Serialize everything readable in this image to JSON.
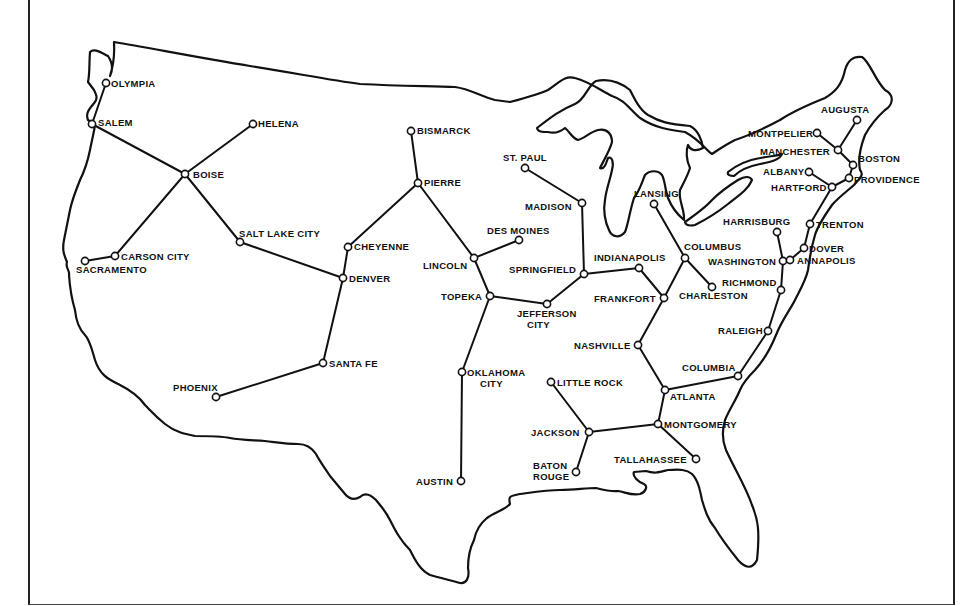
{
  "map": {
    "title": "",
    "subject": "United States state capitals connected as a graph network",
    "colors": {
      "ink": "#111111",
      "background": "#ffffff",
      "frame": "#222222"
    },
    "nodes": [
      {
        "id": "olympia",
        "label": "OLYMPIA",
        "x": 106,
        "y": 83,
        "lx": 111,
        "ly": 87,
        "anchor": "start"
      },
      {
        "id": "salem",
        "label": "SALEM",
        "x": 92,
        "y": 124,
        "lx": 98,
        "ly": 126,
        "anchor": "start"
      },
      {
        "id": "helena",
        "label": "HELENA",
        "x": 253,
        "y": 124,
        "lx": 258,
        "ly": 127,
        "anchor": "start"
      },
      {
        "id": "boise",
        "label": "BOISE",
        "x": 185,
        "y": 174,
        "lx": 193,
        "ly": 178,
        "anchor": "start"
      },
      {
        "id": "carson_city",
        "label": "CARSON CITY",
        "x": 115,
        "y": 256,
        "lx": 121,
        "ly": 260,
        "anchor": "start"
      },
      {
        "id": "sacramento",
        "label": "SACRAMENTO",
        "x": 85,
        "y": 261,
        "lx": 76,
        "ly": 273,
        "anchor": "start"
      },
      {
        "id": "salt_lake_city",
        "label": "SALT LAKE CITY",
        "x": 240,
        "y": 242,
        "lx": 239,
        "ly": 237,
        "anchor": "start"
      },
      {
        "id": "cheyenne",
        "label": "CHEYENNE",
        "x": 348,
        "y": 247,
        "lx": 354,
        "ly": 250,
        "anchor": "start"
      },
      {
        "id": "denver",
        "label": "DENVER",
        "x": 343,
        "y": 278,
        "lx": 349,
        "ly": 282,
        "anchor": "start"
      },
      {
        "id": "santa_fe",
        "label": "SANTA FE",
        "x": 323,
        "y": 363,
        "lx": 329,
        "ly": 367,
        "anchor": "start"
      },
      {
        "id": "phoenix",
        "label": "PHOENIX",
        "x": 216,
        "y": 397,
        "lx": 173,
        "ly": 391,
        "anchor": "start"
      },
      {
        "id": "bismarck",
        "label": "BISMARCK",
        "x": 411,
        "y": 131,
        "lx": 417,
        "ly": 134,
        "anchor": "start"
      },
      {
        "id": "pierre",
        "label": "PIERRE",
        "x": 418,
        "y": 183,
        "lx": 424,
        "ly": 186,
        "anchor": "start"
      },
      {
        "id": "lincoln",
        "label": "LINCOLN",
        "x": 474,
        "y": 258,
        "lx": 423,
        "ly": 269,
        "anchor": "start"
      },
      {
        "id": "des_moines",
        "label": "DES MOINES",
        "x": 519,
        "y": 240,
        "lx": 487,
        "ly": 234,
        "anchor": "start"
      },
      {
        "id": "topeka",
        "label": "TOPEKA",
        "x": 490,
        "y": 296,
        "lx": 441,
        "ly": 300,
        "anchor": "start"
      },
      {
        "id": "jefferson_city",
        "label": "JEFFERSON",
        "label2": "CITY",
        "x": 547,
        "y": 304,
        "lx": 517,
        "ly": 317,
        "anchor": "start"
      },
      {
        "id": "oklahoma_city",
        "label": "OKLAHOMA",
        "label2": "CITY",
        "x": 462,
        "y": 372,
        "lx": 467,
        "ly": 376,
        "anchor": "start"
      },
      {
        "id": "austin",
        "label": "AUSTIN",
        "x": 461,
        "y": 481,
        "lx": 416,
        "ly": 485,
        "anchor": "start"
      },
      {
        "id": "st_paul",
        "label": "ST. PAUL",
        "x": 525,
        "y": 168,
        "lx": 503,
        "ly": 161,
        "anchor": "start"
      },
      {
        "id": "madison",
        "label": "MADISON",
        "x": 582,
        "y": 203,
        "lx": 525,
        "ly": 210,
        "anchor": "start"
      },
      {
        "id": "springfield",
        "label": "SPRINGFIELD",
        "x": 584,
        "y": 274,
        "lx": 509,
        "ly": 273,
        "anchor": "start"
      },
      {
        "id": "indianapolis",
        "label": "INDIANAPOLIS",
        "x": 639,
        "y": 268,
        "lx": 594,
        "ly": 261,
        "anchor": "start"
      },
      {
        "id": "frankfort",
        "label": "FRANKFORT",
        "x": 664,
        "y": 298,
        "lx": 594,
        "ly": 302,
        "anchor": "start"
      },
      {
        "id": "lansing",
        "label": "LANSING",
        "x": 654,
        "y": 204,
        "lx": 634,
        "ly": 197,
        "anchor": "start"
      },
      {
        "id": "columbus",
        "label": "COLUMBUS",
        "x": 685,
        "y": 258,
        "lx": 684,
        "ly": 250,
        "anchor": "start"
      },
      {
        "id": "charleston",
        "label": "CHARLESTON",
        "x": 712,
        "y": 287,
        "lx": 679,
        "ly": 299,
        "anchor": "start"
      },
      {
        "id": "nashville",
        "label": "NASHVILLE",
        "x": 638,
        "y": 345,
        "lx": 574,
        "ly": 349,
        "anchor": "start"
      },
      {
        "id": "atlanta",
        "label": "ATLANTA",
        "x": 665,
        "y": 390,
        "lx": 670,
        "ly": 400,
        "anchor": "start"
      },
      {
        "id": "columbia",
        "label": "COLUMBIA",
        "x": 738,
        "y": 376,
        "lx": 682,
        "ly": 371,
        "anchor": "start"
      },
      {
        "id": "raleigh",
        "label": "RALEIGH",
        "x": 768,
        "y": 331,
        "lx": 718,
        "ly": 334,
        "anchor": "start"
      },
      {
        "id": "richmond",
        "label": "RICHMOND",
        "x": 781,
        "y": 290,
        "lx": 722,
        "ly": 286,
        "anchor": "start"
      },
      {
        "id": "washington",
        "label": "WASHINGTON",
        "x": 783,
        "y": 261,
        "lx": 708,
        "ly": 265,
        "anchor": "start"
      },
      {
        "id": "harrisburg",
        "label": "HARRISBURG",
        "x": 777,
        "y": 232,
        "lx": 723,
        "ly": 225,
        "anchor": "start"
      },
      {
        "id": "annapolis",
        "label": "ANNAPOLIS",
        "x": 790,
        "y": 260,
        "lx": 797,
        "ly": 264,
        "anchor": "start"
      },
      {
        "id": "dover",
        "label": "DOVER",
        "x": 804,
        "y": 248,
        "lx": 809,
        "ly": 252,
        "anchor": "start"
      },
      {
        "id": "trenton",
        "label": "TRENTON",
        "x": 810,
        "y": 224,
        "lx": 816,
        "ly": 228,
        "anchor": "start"
      },
      {
        "id": "montgomery",
        "label": "MONTGOMERY",
        "x": 658,
        "y": 424,
        "lx": 664,
        "ly": 428,
        "anchor": "start"
      },
      {
        "id": "tallahassee",
        "label": "TALLAHASSEE",
        "x": 696,
        "y": 459,
        "lx": 614,
        "ly": 463,
        "anchor": "start"
      },
      {
        "id": "jackson",
        "label": "JACKSON",
        "x": 589,
        "y": 432,
        "lx": 531,
        "ly": 436,
        "anchor": "start"
      },
      {
        "id": "little_rock",
        "label": "LITTLE ROCK",
        "x": 551,
        "y": 382,
        "lx": 557,
        "ly": 386,
        "anchor": "start"
      },
      {
        "id": "baton_rouge",
        "label": "BATON",
        "label2": "ROUGE",
        "x": 576,
        "y": 472,
        "lx": 533,
        "ly": 469,
        "anchor": "start"
      },
      {
        "id": "hartford",
        "label": "HARTFORD",
        "x": 832,
        "y": 187,
        "lx": 771,
        "ly": 191,
        "anchor": "start"
      },
      {
        "id": "providence",
        "label": "PROVIDENCE",
        "x": 849,
        "y": 178,
        "lx": 854,
        "ly": 183,
        "anchor": "start"
      },
      {
        "id": "boston",
        "label": "BOSTON",
        "x": 853,
        "y": 165,
        "lx": 858,
        "ly": 162,
        "anchor": "start"
      },
      {
        "id": "albany",
        "label": "ALBANY",
        "x": 809,
        "y": 172,
        "lx": 763,
        "ly": 175,
        "anchor": "start"
      },
      {
        "id": "manchester",
        "label": "MANCHESTER",
        "x": 838,
        "y": 150,
        "lx": 760,
        "ly": 155,
        "anchor": "start"
      },
      {
        "id": "montpelier",
        "label": "MONTPELIER",
        "x": 817,
        "y": 133,
        "lx": 748,
        "ly": 137,
        "anchor": "start"
      },
      {
        "id": "augusta",
        "label": "AUGUSTA",
        "x": 857,
        "y": 120,
        "lx": 821,
        "ly": 113,
        "anchor": "start"
      }
    ],
    "edges": [
      [
        "olympia",
        "salem"
      ],
      [
        "salem",
        "boise"
      ],
      [
        "helena",
        "boise"
      ],
      [
        "boise",
        "carson_city"
      ],
      [
        "boise",
        "salt_lake_city"
      ],
      [
        "carson_city",
        "sacramento"
      ],
      [
        "salt_lake_city",
        "denver"
      ],
      [
        "cheyenne",
        "denver"
      ],
      [
        "cheyenne",
        "pierre"
      ],
      [
        "denver",
        "santa_fe"
      ],
      [
        "santa_fe",
        "phoenix"
      ],
      [
        "bismarck",
        "pierre"
      ],
      [
        "pierre",
        "lincoln"
      ],
      [
        "lincoln",
        "des_moines"
      ],
      [
        "lincoln",
        "topeka"
      ],
      [
        "topeka",
        "jefferson_city"
      ],
      [
        "topeka",
        "oklahoma_city"
      ],
      [
        "oklahoma_city",
        "austin"
      ],
      [
        "jefferson_city",
        "springfield"
      ],
      [
        "st_paul",
        "madison"
      ],
      [
        "madison",
        "springfield"
      ],
      [
        "springfield",
        "indianapolis"
      ],
      [
        "indianapolis",
        "frankfort"
      ],
      [
        "frankfort",
        "columbus"
      ],
      [
        "lansing",
        "columbus"
      ],
      [
        "columbus",
        "charleston"
      ],
      [
        "frankfort",
        "nashville"
      ],
      [
        "nashville",
        "atlanta"
      ],
      [
        "atlanta",
        "columbia"
      ],
      [
        "columbia",
        "raleigh"
      ],
      [
        "raleigh",
        "richmond"
      ],
      [
        "richmond",
        "washington"
      ],
      [
        "washington",
        "harrisburg"
      ],
      [
        "washington",
        "annapolis"
      ],
      [
        "annapolis",
        "dover"
      ],
      [
        "dover",
        "trenton"
      ],
      [
        "atlanta",
        "montgomery"
      ],
      [
        "montgomery",
        "tallahassee"
      ],
      [
        "montgomery",
        "jackson"
      ],
      [
        "jackson",
        "little_rock"
      ],
      [
        "jackson",
        "baton_rouge"
      ],
      [
        "trenton",
        "hartford"
      ],
      [
        "hartford",
        "albany"
      ],
      [
        "hartford",
        "providence"
      ],
      [
        "providence",
        "boston"
      ],
      [
        "boston",
        "manchester"
      ],
      [
        "manchester",
        "montpelier"
      ],
      [
        "manchester",
        "augusta"
      ]
    ]
  }
}
